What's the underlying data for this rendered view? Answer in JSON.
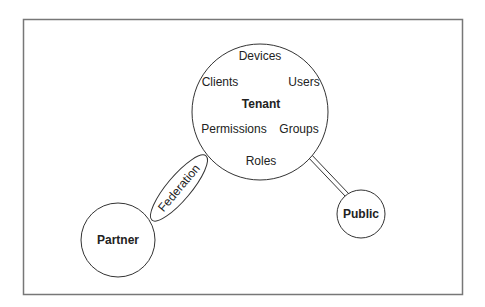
{
  "diagram": {
    "center_node": {
      "label": "Tenant",
      "members": {
        "top": "Devices",
        "left": "Clients",
        "right": "Users",
        "bottom_left": "Permissions",
        "bottom_right": "Groups",
        "bottom": "Roles"
      }
    },
    "nodes": [
      {
        "id": "partner",
        "label": "Partner"
      },
      {
        "id": "public",
        "label": "Public"
      }
    ],
    "edges": [
      {
        "from": "tenant",
        "to": "partner",
        "label": "Federation",
        "style": "ellipse-band"
      },
      {
        "from": "tenant",
        "to": "public",
        "label": "",
        "style": "double-line"
      }
    ]
  }
}
